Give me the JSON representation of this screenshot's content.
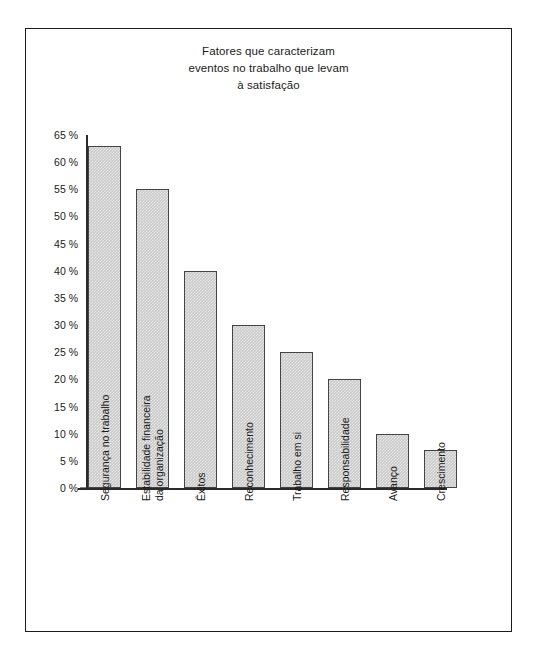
{
  "chart_data": {
    "type": "bar",
    "title": "Fatores que caracterizam eventos no trabalho que levam à satisfação",
    "title_lines": [
      "Fatores que caracterizam",
      "eventos no trabalho que levam",
      "à satisfação"
    ],
    "categories": [
      "Segurança no trabalho",
      "Estabilidade financeira da organização",
      "Êxitos",
      "Reconhecimento",
      "Trabalho em si",
      "Responsabilidade",
      "Avanço",
      "Crescimento"
    ],
    "category_lines": [
      [
        "Segurança no trabalho"
      ],
      [
        "Estabilidade financeira",
        "da organização"
      ],
      [
        "Êxitos"
      ],
      [
        "Reconhecimento"
      ],
      [
        "Trabalho em si"
      ],
      [
        "Responsabilidade"
      ],
      [
        "Avanço"
      ],
      [
        "Crescimento"
      ]
    ],
    "values": [
      63,
      55,
      40,
      30,
      25,
      20,
      10,
      7
    ],
    "xlabel": "",
    "ylabel": "",
    "ylim": [
      0,
      65
    ],
    "ytick_values": [
      65,
      60,
      55,
      50,
      45,
      40,
      35,
      30,
      25,
      20,
      15,
      10,
      5,
      0
    ],
    "ytick_labels": [
      "65 %",
      "60 %",
      "55 %",
      "50 %",
      "45 %",
      "40 %",
      "35 %",
      "30 %",
      "25 %",
      "20 %",
      "15 %",
      "10 %",
      "5 %",
      "0 %"
    ],
    "grid": false,
    "legend": null,
    "colors": {
      "bar_fill": "#c9c9c9",
      "bar_border": "#444444",
      "axis": "#2a2a2a",
      "text": "#1b1b1b",
      "frame": "#1c1c1c",
      "background": "#ffffff"
    }
  }
}
